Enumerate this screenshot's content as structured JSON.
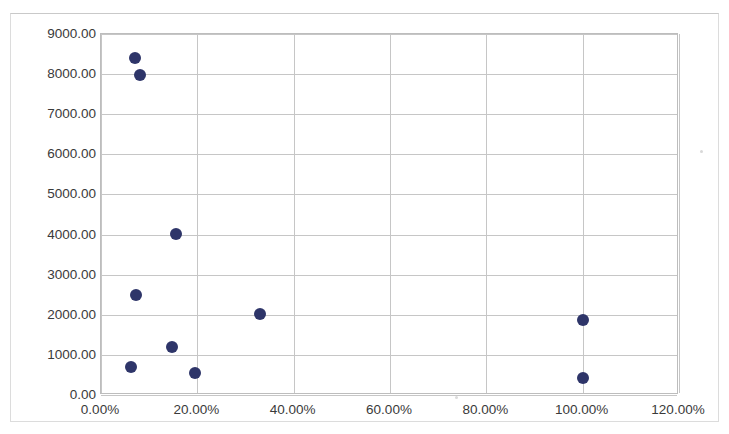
{
  "chart_data": {
    "type": "scatter",
    "title": "",
    "xlabel": "",
    "ylabel": "",
    "xlim": [
      0,
      1.2
    ],
    "ylim": [
      0,
      9000
    ],
    "grid": true,
    "legend": false,
    "marker_color": "#2e3569",
    "x_tick_labels": [
      "0.00%",
      "20.00%",
      "40.00%",
      "60.00%",
      "80.00%",
      "100.00%",
      "120.00%"
    ],
    "x_tick_values": [
      0,
      0.2,
      0.4,
      0.6,
      0.8,
      1.0,
      1.2
    ],
    "y_tick_labels": [
      "0.00",
      "1000.00",
      "2000.00",
      "3000.00",
      "4000.00",
      "5000.00",
      "6000.00",
      "7000.00",
      "8000.00",
      "9000.00"
    ],
    "y_tick_values": [
      0,
      1000,
      2000,
      3000,
      4000,
      5000,
      6000,
      7000,
      8000,
      9000
    ],
    "series": [
      {
        "name": "Series 1",
        "points": [
          {
            "x": 0.07,
            "y": 8400
          },
          {
            "x": 0.082,
            "y": 7980
          },
          {
            "x": 0.156,
            "y": 4020
          },
          {
            "x": 0.072,
            "y": 2500
          },
          {
            "x": 0.33,
            "y": 2030
          },
          {
            "x": 1.0,
            "y": 1880
          },
          {
            "x": 0.148,
            "y": 1200
          },
          {
            "x": 0.062,
            "y": 700
          },
          {
            "x": 0.196,
            "y": 540
          },
          {
            "x": 1.0,
            "y": 430
          }
        ]
      }
    ]
  }
}
